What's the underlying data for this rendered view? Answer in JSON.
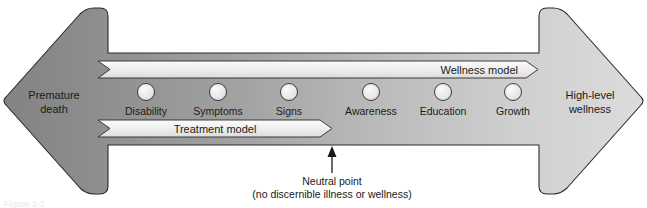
{
  "figure": {
    "left_end": {
      "line1": "Premature",
      "line2": "death"
    },
    "right_end": {
      "line1": "High-level",
      "line2": "wellness"
    },
    "bands": [
      {
        "id": "wellness-model",
        "label": "Wellness model",
        "align": "right"
      },
      {
        "id": "treatment-model",
        "label": "Treatment model",
        "align": "center"
      }
    ],
    "nodes": [
      {
        "label": "Disability"
      },
      {
        "label": "Symptoms"
      },
      {
        "label": "Signs"
      },
      {
        "label": "Awareness"
      },
      {
        "label": "Education"
      },
      {
        "label": "Growth"
      }
    ],
    "callout": {
      "line1": "Neutral point",
      "line2": "(no discernible illness or wellness)"
    },
    "caption": "Figure 1-1",
    "colors": {
      "arrow_dark": "#8b8b8b",
      "arrow_light": "#d6d6d6",
      "band_fill": "#ececec",
      "node_fill": "#e4e4e4",
      "outline": "#2b2b2b",
      "text": "#1a1a1a"
    }
  }
}
